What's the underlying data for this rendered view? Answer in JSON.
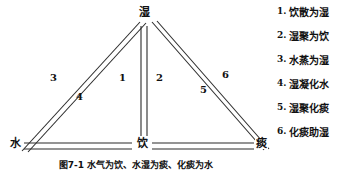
{
  "figure": {
    "caption": "图7-1  水气为饮、水湿为痰、化痰为水"
  },
  "diagram": {
    "type": "triangle-relationship-diagram",
    "line_color": "#2b2b2b",
    "background": "#ffffff",
    "nodes": [
      {
        "id": "shi",
        "label": "湿",
        "position": "top"
      },
      {
        "id": "shui",
        "label": "水",
        "position": "bottom-left"
      },
      {
        "id": "yin",
        "label": "饮",
        "position": "bottom-center"
      },
      {
        "id": "tan",
        "label": "痰",
        "position": "bottom-right"
      }
    ],
    "edge_numbers": [
      {
        "id": "num-1",
        "label": "1",
        "edge": "shi-yin-left"
      },
      {
        "id": "num-2",
        "label": "2",
        "edge": "shi-yin-right"
      },
      {
        "id": "num-3",
        "label": "3",
        "edge": "shui-shi-upper"
      },
      {
        "id": "num-4",
        "label": "4",
        "edge": "shui-shi-lower"
      },
      {
        "id": "num-5",
        "label": "5",
        "edge": "shi-tan-lower"
      },
      {
        "id": "num-6",
        "label": "6",
        "edge": "shi-tan-upper"
      }
    ]
  },
  "legend": {
    "items": [
      {
        "index": "1.",
        "text": "饮散为湿"
      },
      {
        "index": "2.",
        "text": "湿聚为饮"
      },
      {
        "index": "3.",
        "text": "水蒸为湿"
      },
      {
        "index": "4.",
        "text": "湿凝化水"
      },
      {
        "index": "5.",
        "text": "湿聚化痰"
      },
      {
        "index": "6.",
        "text": "化痰助湿"
      }
    ]
  }
}
